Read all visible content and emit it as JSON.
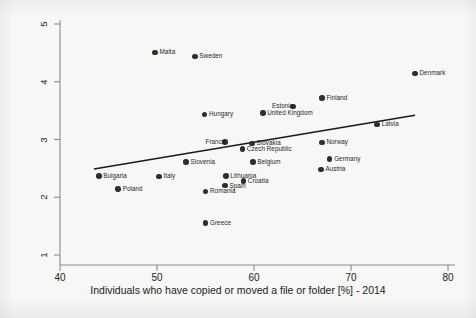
{
  "chart_data": {
    "type": "scatter",
    "title": "",
    "xlabel": "Individuals who have copied or moved a file or folder [%] - 2014",
    "ylabel": "",
    "xlim": [
      40,
      80
    ],
    "ylim": [
      1,
      5
    ],
    "xticks": [
      40,
      50,
      60,
      70,
      80
    ],
    "yticks": [
      1,
      2,
      3,
      4,
      5
    ],
    "grid": false,
    "legend": "none",
    "point_color": "#2e2e2e",
    "line_color": "#1a1a1a",
    "background_color": "#f7f7f5",
    "axis_color": "#8c8c8c",
    "points": [
      {
        "label": "Malta",
        "x": 49.8,
        "y": 4.51,
        "label_pos": "right"
      },
      {
        "label": "Sweden",
        "x": 53.9,
        "y": 4.44,
        "label_pos": "right"
      },
      {
        "label": "Denmark",
        "x": 76.6,
        "y": 4.14,
        "label_pos": "right"
      },
      {
        "label": "Finland",
        "x": 67.0,
        "y": 3.72,
        "label_pos": "right"
      },
      {
        "label": "Estonia",
        "x": 64.0,
        "y": 3.57,
        "label_pos": "left"
      },
      {
        "label": "United Kingdom",
        "x": 60.9,
        "y": 3.46,
        "label_pos": "right"
      },
      {
        "label": "Hungary",
        "x": 54.9,
        "y": 3.43,
        "label_pos": "right"
      },
      {
        "label": "Latvia",
        "x": 72.7,
        "y": 3.26,
        "label_pos": "right"
      },
      {
        "label": "France",
        "x": 57.0,
        "y": 2.96,
        "label_pos": "left"
      },
      {
        "label": "Norway",
        "x": 67.0,
        "y": 2.95,
        "label_pos": "right"
      },
      {
        "label": "Slovakia",
        "x": 59.8,
        "y": 2.93,
        "label_pos": "right"
      },
      {
        "label": "Czech Republic",
        "x": 58.8,
        "y": 2.84,
        "label_pos": "right"
      },
      {
        "label": "Germany",
        "x": 67.8,
        "y": 2.66,
        "label_pos": "right"
      },
      {
        "label": "Slovenia",
        "x": 53.0,
        "y": 2.61,
        "label_pos": "right"
      },
      {
        "label": "Belgium",
        "x": 59.9,
        "y": 2.61,
        "label_pos": "right"
      },
      {
        "label": "Austria",
        "x": 66.9,
        "y": 2.48,
        "label_pos": "right"
      },
      {
        "label": "Bulgaria",
        "x": 44.0,
        "y": 2.37,
        "label_pos": "right"
      },
      {
        "label": "Italy",
        "x": 50.2,
        "y": 2.36,
        "label_pos": "right"
      },
      {
        "label": "Lithuania",
        "x": 57.1,
        "y": 2.37,
        "label_pos": "right"
      },
      {
        "label": "Croatia",
        "x": 58.9,
        "y": 2.28,
        "label_pos": "right"
      },
      {
        "label": "Spain",
        "x": 57.0,
        "y": 2.2,
        "label_pos": "right"
      },
      {
        "label": "Poland",
        "x": 46.0,
        "y": 2.14,
        "label_pos": "right"
      },
      {
        "label": "Romania",
        "x": 55.0,
        "y": 2.1,
        "label_pos": "right"
      },
      {
        "label": "Greece",
        "x": 55.0,
        "y": 1.55,
        "label_pos": "right"
      }
    ],
    "trendline": {
      "x0": 43.5,
      "y0": 2.49,
      "x1": 76.6,
      "y1": 3.42
    }
  }
}
